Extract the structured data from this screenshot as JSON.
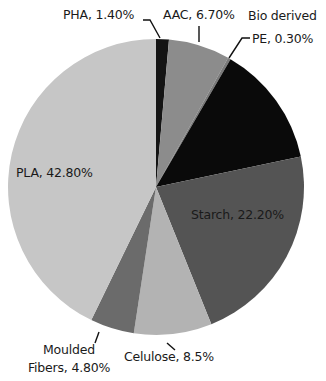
{
  "chart_data": {
    "type": "pie",
    "title": "",
    "start_angle_deg": 0,
    "direction": "clockwise",
    "slices": [
      {
        "name": "PHA",
        "value": 1.4,
        "label": "PHA, 1.40%",
        "color": "#141414"
      },
      {
        "name": "AAC",
        "value": 6.7,
        "label": "AAC, 6.70%",
        "color": "#8c8c8c"
      },
      {
        "name": "Bio derived PE",
        "value": 0.3,
        "label": "Bio derived PE, 0.30%",
        "color": "#7a7a7a"
      },
      {
        "name": "Unlabeled",
        "value": 13.3,
        "label": "",
        "color": "#0a0a0a"
      },
      {
        "name": "Starch",
        "value": 22.2,
        "label": "Starch, 22.20%",
        "color": "#545454"
      },
      {
        "name": "Celulose",
        "value": 8.5,
        "label": "Celulose, 8.5%",
        "color": "#b3b3b3"
      },
      {
        "name": "Moulded Fibers",
        "value": 4.8,
        "label": "Moulded Fibers, 4.80%",
        "color": "#6b6b6b"
      },
      {
        "name": "PLA",
        "value": 42.8,
        "label": "PLA, 42.80%",
        "color": "#c6c6c6"
      }
    ],
    "legend": "none (data labels with leader lines)"
  },
  "labels": {
    "pha": "PHA, 1.40%",
    "aac": "AAC, 6.70%",
    "pe_line1": "Bio derived",
    "pe_line2": "PE, 0.30%",
    "starch": "Starch, 22.20%",
    "celulose": "Celulose, 8.5%",
    "moulded_line1": "Moulded",
    "moulded_line2": "Fibers, 4.80%",
    "pla": "PLA, 42.80%"
  }
}
